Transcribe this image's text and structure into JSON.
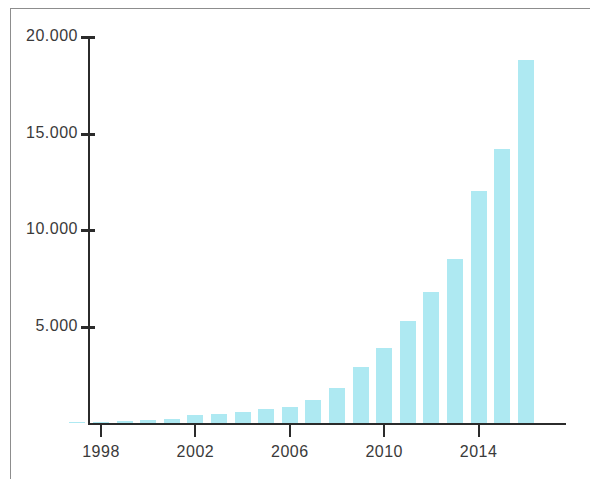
{
  "chart_data": {
    "type": "bar",
    "title": "",
    "subtitle": "",
    "xlabel": "",
    "ylabel": "",
    "grid": false,
    "legend": null,
    "xlim": [
      1996.4,
      2016.6
    ],
    "ylim": [
      0,
      20000
    ],
    "y_tick_labels": [
      "20.000",
      "15.000",
      "10.000",
      "5.000"
    ],
    "y_tick_values": [
      20000,
      15000,
      10000,
      5000
    ],
    "x_tick_labels": [
      "1998",
      "2002",
      "2006",
      "2010",
      "2014"
    ],
    "x_tick_values": [
      1998,
      2002,
      2006,
      2010,
      2014
    ],
    "bar_color": "#aee9f2",
    "axis_color": "#2b2b2b",
    "frame_color": "#8d8d8d",
    "categories": [
      "1997",
      "1998",
      "1999",
      "2000",
      "2001",
      "2002",
      "2003",
      "2004",
      "2005",
      "2006",
      "2007",
      "2008",
      "2009",
      "2010",
      "2011",
      "2012",
      "2013",
      "2014",
      "2015",
      "2016"
    ],
    "values": [
      40,
      60,
      90,
      130,
      200,
      420,
      480,
      560,
      700,
      850,
      1200,
      1800,
      2900,
      3900,
      5300,
      6800,
      8500,
      12000,
      14200,
      18800
    ]
  }
}
